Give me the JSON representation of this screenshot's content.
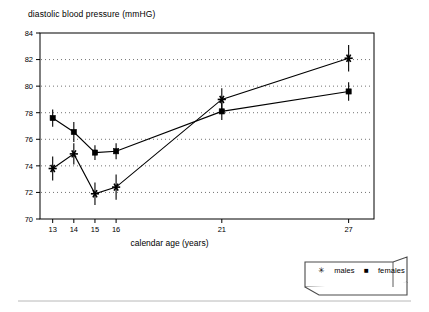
{
  "chart_data": {
    "type": "line",
    "title": "diastolic blood pressure (mmHG)",
    "xlabel": "calendar age (years)",
    "ylabel": "",
    "x": [
      13,
      14,
      15,
      16,
      21,
      27
    ],
    "categories": [
      "13",
      "14",
      "15",
      "16",
      "21",
      "27"
    ],
    "xtick_labels": [
      "13",
      "14",
      "15",
      "16",
      "21",
      "27"
    ],
    "ytick_labels": [
      "70",
      "72",
      "74",
      "76",
      "78",
      "80",
      "82",
      "84"
    ],
    "ylim": [
      70,
      84
    ],
    "xlim": [
      12.4,
      28.2
    ],
    "grid": "horizontal-dotted",
    "legend_position": "bottom-right",
    "series": [
      {
        "name": "males",
        "marker": "asterisk",
        "values": [
          73.8,
          74.9,
          71.9,
          72.4,
          79.0,
          82.1
        ],
        "errors": [
          0.9,
          0.8,
          0.85,
          0.95,
          0.85,
          1.0
        ]
      },
      {
        "name": "females",
        "marker": "square",
        "values": [
          77.6,
          76.55,
          75.0,
          75.1,
          78.1,
          79.6
        ],
        "errors": [
          0.65,
          0.75,
          0.55,
          0.6,
          0.65,
          0.7
        ]
      }
    ]
  },
  "legend": {
    "males_symbol": "✳",
    "males_label": "males",
    "females_symbol": "■",
    "females_label": "females"
  }
}
